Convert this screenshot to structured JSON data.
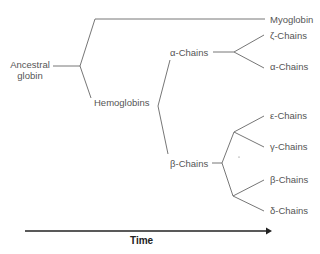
{
  "diagram": {
    "root_label_line1": "Ancestral",
    "root_label_line2": "globin",
    "labels": {
      "myoglobin": "Myoglobin",
      "hemoglobins": "Hemoglobins",
      "alpha_group": "α-Chains",
      "beta_group": "β-Chains",
      "zeta": "ζ-Chains",
      "alpha": "α-Chains",
      "epsilon": "ε-Chains",
      "gamma": "γ-Chains",
      "beta": "β-Chains",
      "delta": "δ-Chains"
    },
    "axis_label": "Time",
    "colors": {
      "line": "#666666",
      "axis": "#222222",
      "text": "#555555"
    }
  }
}
